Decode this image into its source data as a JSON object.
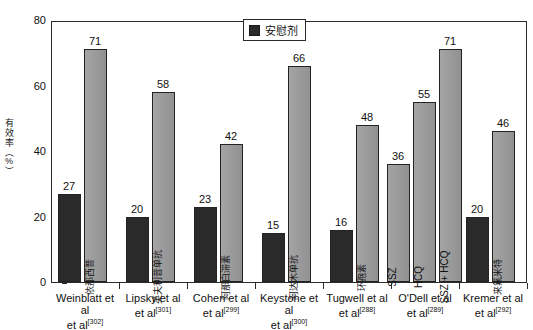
{
  "chart_data": {
    "type": "bar",
    "title": "",
    "subtitle": "",
    "xlabel": "",
    "ylabel": "有效率（%）",
    "ylim": [
      0,
      80
    ],
    "ytick_labels": [
      "0",
      "20",
      "40",
      "60",
      "80"
    ],
    "ytick_values": [
      0,
      20,
      40,
      60,
      80
    ],
    "grid": false,
    "legend": {
      "position": "top-center",
      "entries": [
        {
          "label": "安慰剂",
          "color": "#2a2a2a"
        }
      ]
    },
    "categories": [
      "Weinblatt et al",
      "Lipsky et al",
      "Cohen et al",
      "Keystone et al",
      "Tugwell et al",
      "O'Dell et al",
      "Kremer et al"
    ],
    "category_refs": [
      "302",
      "301",
      "299",
      "300",
      "288",
      "289",
      "292"
    ],
    "groups": [
      {
        "category": "Weinblatt et al",
        "ref": "302",
        "bars": [
          {
            "series": "安慰剂",
            "label": "",
            "value": 27,
            "color": "#2a2a2a",
            "kind": "placebo"
          },
          {
            "series": "治疗",
            "label": "依那西普",
            "value": 71,
            "color": "#9a9a9a",
            "kind": "treat"
          }
        ]
      },
      {
        "category": "Lipsky et al",
        "ref": "301",
        "bars": [
          {
            "series": "安慰剂",
            "label": "",
            "value": 20,
            "color": "#2a2a2a",
            "kind": "placebo"
          },
          {
            "series": "治疗",
            "label": "英夫利昔单抗",
            "value": 58,
            "color": "#9a9a9a",
            "kind": "treat"
          }
        ]
      },
      {
        "category": "Cohen et al",
        "ref": "299",
        "bars": [
          {
            "series": "安慰剂",
            "label": "",
            "value": 23,
            "color": "#2a2a2a",
            "kind": "placebo"
          },
          {
            "series": "治疗",
            "label": "阿那白滞素",
            "value": 42,
            "color": "#9a9a9a",
            "kind": "treat"
          }
        ]
      },
      {
        "category": "Keystone et al",
        "ref": "300",
        "bars": [
          {
            "series": "安慰剂",
            "label": "",
            "value": 15,
            "color": "#2a2a2a",
            "kind": "placebo"
          },
          {
            "series": "治疗",
            "label": "阿达木单抗",
            "value": 66,
            "color": "#9a9a9a",
            "kind": "treat"
          }
        ]
      },
      {
        "category": "Tugwell et al",
        "ref": "288",
        "bars": [
          {
            "series": "安慰剂",
            "label": "",
            "value": 16,
            "color": "#2a2a2a",
            "kind": "placebo"
          },
          {
            "series": "治疗",
            "label": "环孢素",
            "value": 48,
            "color": "#9a9a9a",
            "kind": "treat"
          }
        ]
      },
      {
        "category": "O'Dell et al",
        "ref": "289",
        "bars": [
          {
            "series": "治疗",
            "label": "SSZ",
            "value": 36,
            "color": "#9a9a9a",
            "kind": "treat",
            "latin": true
          },
          {
            "series": "治疗",
            "label": "HCQ",
            "value": 55,
            "color": "#9a9a9a",
            "kind": "treat",
            "latin": true
          },
          {
            "series": "治疗",
            "label": "SSZ + HCQ",
            "value": 71,
            "color": "#9a9a9a",
            "kind": "treat",
            "latin": true
          }
        ]
      },
      {
        "category": "Kremer et al",
        "ref": "292",
        "bars": [
          {
            "series": "安慰剂",
            "label": "",
            "value": 20,
            "color": "#2a2a2a",
            "kind": "placebo"
          },
          {
            "series": "治疗",
            "label": "来氟米特",
            "value": 46,
            "color": "#9a9a9a",
            "kind": "treat"
          }
        ]
      }
    ]
  },
  "colors": {
    "placebo": "#2a2a2a",
    "treatment": "#9a9a9a",
    "axis": "#2b2b2b",
    "text": "#111111",
    "background": "#ffffff"
  }
}
